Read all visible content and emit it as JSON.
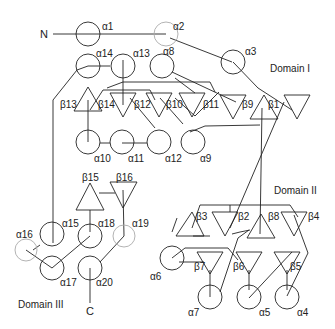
{
  "diagram": {
    "type": "protein-topology",
    "terminals": {
      "n": "N",
      "c": "C"
    },
    "domains": [
      {
        "id": "d1",
        "label": "Domain I"
      },
      {
        "id": "d2",
        "label": "Domain II"
      },
      {
        "id": "d3",
        "label": "Domain III"
      }
    ],
    "helices": [
      {
        "id": "a1",
        "label": "α1"
      },
      {
        "id": "a2",
        "label": "α2"
      },
      {
        "id": "a3",
        "label": "α3"
      },
      {
        "id": "a4",
        "label": "α4"
      },
      {
        "id": "a5",
        "label": "α5"
      },
      {
        "id": "a6",
        "label": "α6"
      },
      {
        "id": "a7",
        "label": "α7"
      },
      {
        "id": "a8",
        "label": "α8"
      },
      {
        "id": "a9",
        "label": "α9"
      },
      {
        "id": "a10",
        "label": "α10"
      },
      {
        "id": "a11",
        "label": "α11"
      },
      {
        "id": "a12",
        "label": "α12"
      },
      {
        "id": "a13",
        "label": "α13"
      },
      {
        "id": "a14",
        "label": "α14"
      },
      {
        "id": "a15",
        "label": "α15"
      },
      {
        "id": "a16",
        "label": "α16"
      },
      {
        "id": "a17",
        "label": "α17"
      },
      {
        "id": "a18",
        "label": "α18"
      },
      {
        "id": "a19",
        "label": "α19"
      },
      {
        "id": "a20",
        "label": "α20"
      }
    ],
    "strands": [
      {
        "id": "b1",
        "label": "β1"
      },
      {
        "id": "b2",
        "label": "β2"
      },
      {
        "id": "b3",
        "label": "β3"
      },
      {
        "id": "b4",
        "label": "β4"
      },
      {
        "id": "b5",
        "label": "β5"
      },
      {
        "id": "b6",
        "label": "β6"
      },
      {
        "id": "b7",
        "label": "β7"
      },
      {
        "id": "b8",
        "label": "β8"
      },
      {
        "id": "b9",
        "label": "β9"
      },
      {
        "id": "b10",
        "label": "β10"
      },
      {
        "id": "b11",
        "label": "β11"
      },
      {
        "id": "b12",
        "label": "β12"
      },
      {
        "id": "b13",
        "label": "β13"
      },
      {
        "id": "b14",
        "label": "β14"
      },
      {
        "id": "b15",
        "label": "β15"
      },
      {
        "id": "b16",
        "label": "β16"
      }
    ]
  }
}
